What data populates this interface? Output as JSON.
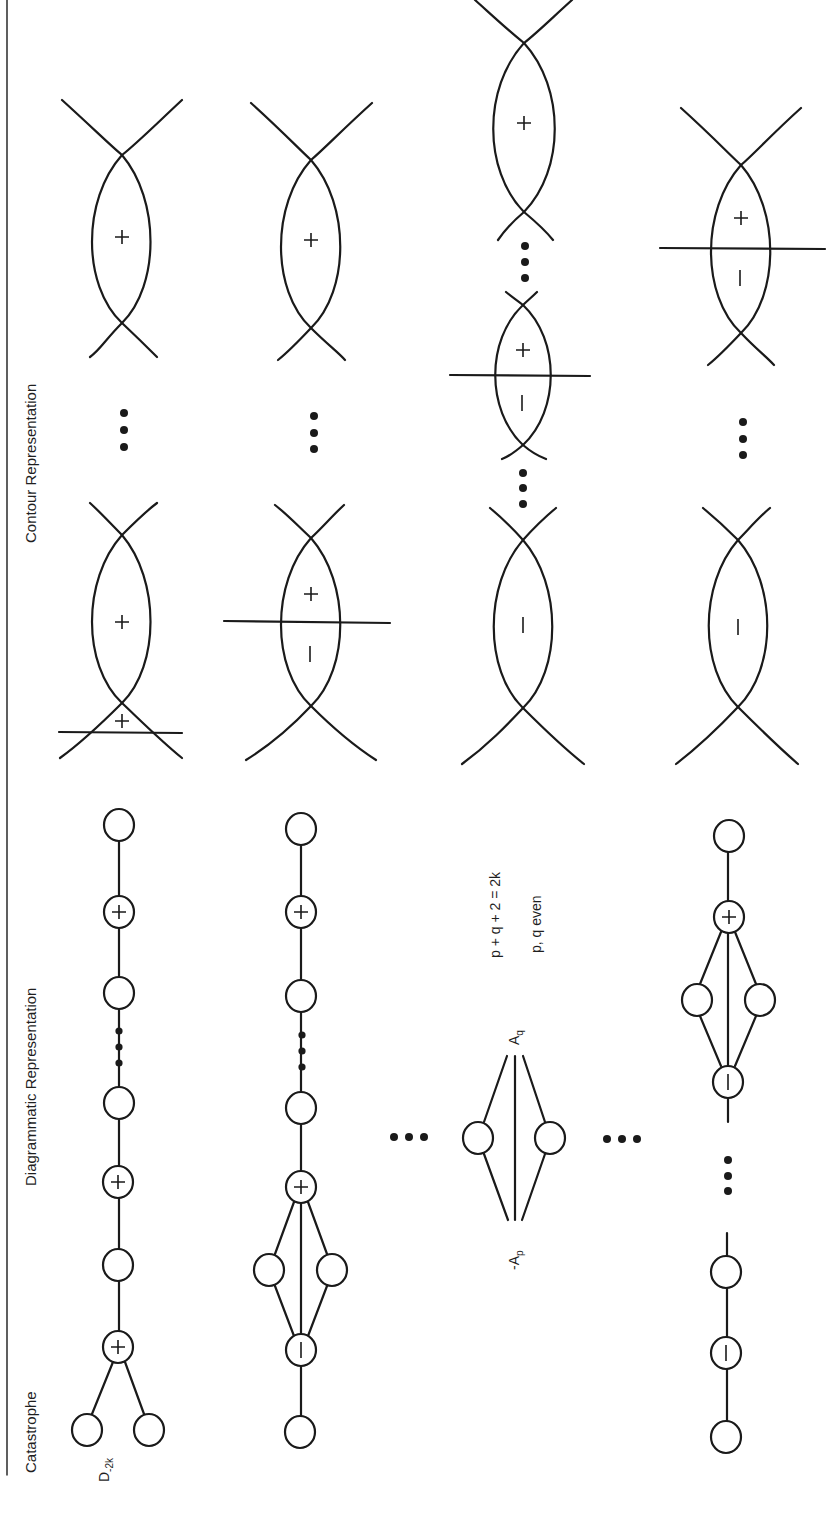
{
  "figure": {
    "orientation": "rotated 90 degrees counter-clockwise",
    "headers": {
      "catastrophe": "Catastrophe",
      "diagrammatic": "Diagrammatic Representation",
      "contour": "Contour Representation"
    },
    "rows": [
      {
        "catastrophe_label": "D",
        "catastrophe_sub": "-2k",
        "diagram": "chain: fork of two empty nodes — (+) — empty — (+) — empty ... empty — (+) — empty",
        "contour": "two lens regions marked +; lower lens cut near its bottom crossing, with + below"
      },
      {
        "catastrophe_label": "",
        "diagram": "empty — (−) — diamond of two empty nodes — (+) — empty ... empty — (+) — empty",
        "contour": "lower lens cut through middle (+ above, − below); upper lens +"
      },
      {
        "catastrophe_label": "",
        "diagram": "two empty nodes between -A_p and A_q bundles",
        "label_ap": "-A",
        "label_ap_sub": "p",
        "label_aq": "A",
        "label_aq_sub": "q",
        "formula_1": "p + q + 2 = 2k",
        "formula_2": "p, q  even",
        "contour": "lower lens −, small middle lens cut (+ / −), upper lens +"
      },
      {
        "catastrophe_label": "",
        "diagram": "empty — (−) — empty ... (−) — diamond of two empty nodes — (+) — empty",
        "contour": "lower lens −; upper lens cut through middle (+ / −)"
      }
    ],
    "node_signs": {
      "plus": "+",
      "minus": "−"
    },
    "ellipsis": "•••",
    "colors": {
      "ink": "#1a1a1a",
      "paper": "#ffffff"
    }
  }
}
